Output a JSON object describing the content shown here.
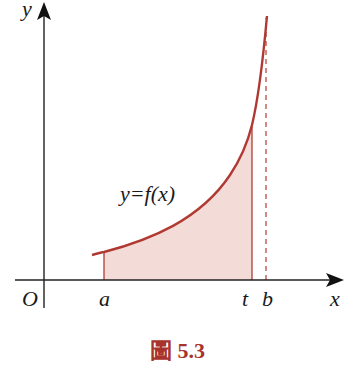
{
  "figure": {
    "axes": {
      "x_label": "x",
      "y_label": "y",
      "origin_label": "O"
    },
    "points": {
      "a_label": "a",
      "t_label": "t",
      "b_label": "b"
    },
    "curve_label": "y=f(x)",
    "caption": "圖 5.3",
    "colors": {
      "curve": "#b03a33",
      "fill": "#f3dcd8",
      "axis": "#222222",
      "caption": "#a8332c"
    }
  }
}
